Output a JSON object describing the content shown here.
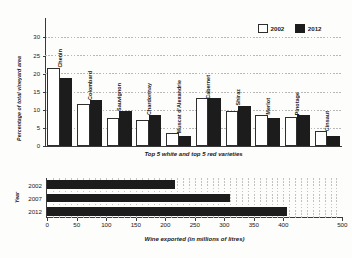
{
  "chart_data": [
    {
      "type": "bar",
      "title": "",
      "xlabel": "Top 5 white and top 5 red varieties",
      "ylabel": "Percentage of total vineyard area",
      "ylim": [
        0,
        35
      ],
      "yticks": [
        0,
        5,
        10,
        15,
        20,
        25,
        30
      ],
      "grid": true,
      "legend_position": "top-right",
      "categories": [
        "Chenin",
        "Colombard",
        "Sauvignon",
        "Chardonnay",
        "Muscat d'Alexandrie",
        "Cabernet",
        "Shiraz",
        "Merlot",
        "Pinotage",
        "Cinsaut"
      ],
      "series": [
        {
          "name": "2002",
          "color": "#ffffff",
          "values": [
            21,
            11,
            7,
            6.5,
            3,
            12.5,
            9,
            8,
            7.5,
            3.5
          ]
        },
        {
          "name": "2012",
          "color": "#1c1c1c",
          "values": [
            18,
            12,
            9,
            8,
            2,
            12.5,
            10.5,
            7,
            8,
            2
          ]
        }
      ]
    },
    {
      "type": "bar",
      "orientation": "horizontal",
      "title": "",
      "xlabel": "Wine exported (in millions of litres)",
      "ylabel": "Year",
      "xlim": [
        0,
        500
      ],
      "xticks": [
        0,
        50,
        100,
        150,
        200,
        250,
        300,
        350,
        400,
        500
      ],
      "xtick_labels": [
        "0",
        "50",
        "100",
        "150",
        "200",
        "250",
        "300",
        "350",
        "400",
        "500"
      ],
      "grid": true,
      "categories": [
        "2002",
        "2007",
        "2012"
      ],
      "values": [
        217,
        310,
        407
      ],
      "bar_color": "#1c1c1c"
    }
  ],
  "top_chart": {
    "ylabel": "Percentage of total vineyard area",
    "xlabel": "Top 5 white and top 5 red varieties",
    "legend": [
      {
        "label": "2002",
        "swatch": "white"
      },
      {
        "label": "2012",
        "swatch": "black"
      }
    ]
  },
  "bottom_chart": {
    "ylabel": "Year",
    "xlabel": "Wine exported (in millions of litres)"
  }
}
